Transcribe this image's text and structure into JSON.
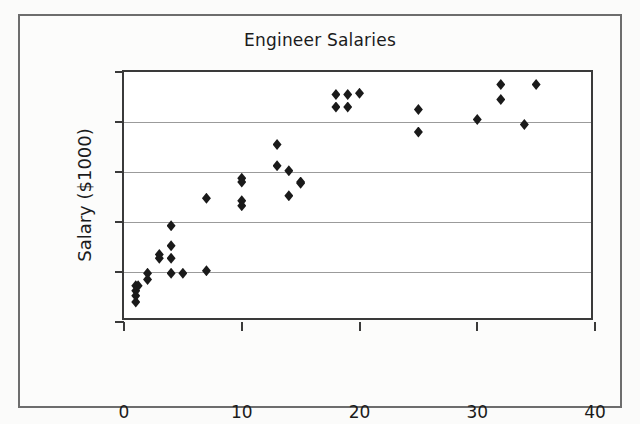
{
  "figure": {
    "background_color": "#fbfbfa",
    "frame_color": "#6d6d6d"
  },
  "chart_data": {
    "type": "scatter",
    "title": "Engineer Salaries",
    "xlabel": "Years",
    "ylabel": "Salary ($1000)",
    "xlim": [
      0,
      40
    ],
    "ylim": [
      40,
      140
    ],
    "xticks": [
      0,
      10,
      20,
      30,
      40
    ],
    "yticks": [
      40,
      60,
      80,
      100,
      120,
      140
    ],
    "xtick_labels": [
      "0",
      "10",
      "20",
      "30",
      "40"
    ],
    "ytick_labels": [
      "40",
      "60",
      "80",
      "100",
      "120",
      "140"
    ],
    "grid": "horizontal",
    "grid_color": "#9b9b9b",
    "marker": "diamond",
    "marker_color": "#1a1a1a",
    "legend": null,
    "points": [
      {
        "x": 1.0,
        "y": 48.0
      },
      {
        "x": 1.0,
        "y": 50.5
      },
      {
        "x": 1.0,
        "y": 52.5
      },
      {
        "x": 1.0,
        "y": 54.5
      },
      {
        "x": 1.2,
        "y": 54.5
      },
      {
        "x": 2.0,
        "y": 57.0
      },
      {
        "x": 2.0,
        "y": 59.5
      },
      {
        "x": 3.0,
        "y": 65.5
      },
      {
        "x": 3.0,
        "y": 67.0
      },
      {
        "x": 4.0,
        "y": 78.5
      },
      {
        "x": 4.0,
        "y": 70.5
      },
      {
        "x": 4.0,
        "y": 65.5
      },
      {
        "x": 4.0,
        "y": 59.5
      },
      {
        "x": 5.0,
        "y": 59.5
      },
      {
        "x": 7.0,
        "y": 60.5
      },
      {
        "x": 7.0,
        "y": 89.5
      },
      {
        "x": 10.0,
        "y": 97.5
      },
      {
        "x": 10.0,
        "y": 96.0
      },
      {
        "x": 10.0,
        "y": 88.5
      },
      {
        "x": 10.0,
        "y": 86.5
      },
      {
        "x": 13.0,
        "y": 111.0
      },
      {
        "x": 13.0,
        "y": 102.5
      },
      {
        "x": 14.0,
        "y": 100.5
      },
      {
        "x": 14.0,
        "y": 90.5
      },
      {
        "x": 15.0,
        "y": 96.0
      },
      {
        "x": 15.0,
        "y": 95.5
      },
      {
        "x": 18.0,
        "y": 131.0
      },
      {
        "x": 18.0,
        "y": 126.0
      },
      {
        "x": 19.0,
        "y": 131.0
      },
      {
        "x": 19.0,
        "y": 126.0
      },
      {
        "x": 20.0,
        "y": 131.5
      },
      {
        "x": 25.0,
        "y": 125.0
      },
      {
        "x": 25.0,
        "y": 116.0
      },
      {
        "x": 30.0,
        "y": 121.0
      },
      {
        "x": 32.0,
        "y": 135.0
      },
      {
        "x": 32.0,
        "y": 129.0
      },
      {
        "x": 34.0,
        "y": 119.0
      },
      {
        "x": 35.0,
        "y": 135.0
      }
    ]
  }
}
